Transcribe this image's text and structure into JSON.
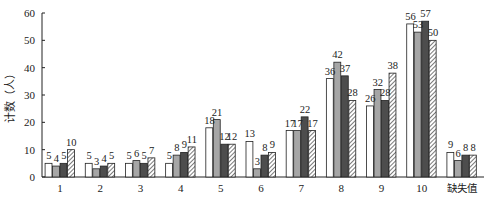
{
  "chart_data": {
    "type": "bar",
    "title": "",
    "xlabel": "",
    "ylabel": "计数（人）",
    "ylim": [
      0,
      60
    ],
    "yticks": [
      0,
      10,
      20,
      30,
      40,
      50,
      60
    ],
    "grid": false,
    "legend": null,
    "categories": [
      "1",
      "2",
      "3",
      "4",
      "5",
      "6",
      "7",
      "8",
      "9",
      "10",
      "缺失值"
    ],
    "series": [
      {
        "name": "series-1",
        "style": "white",
        "color": "#ffffff",
        "values": [
          5,
          5,
          5,
          5,
          18,
          13,
          17,
          36,
          26,
          56,
          9
        ]
      },
      {
        "name": "series-2",
        "style": "light-gray",
        "color": "#a6a6a6",
        "values": [
          4,
          3,
          6,
          8,
          21,
          3,
          17,
          42,
          32,
          53,
          6
        ]
      },
      {
        "name": "series-3",
        "style": "dark-gray",
        "color": "#4d4d4d",
        "values": [
          5,
          4,
          5,
          9,
          12,
          8,
          22,
          37,
          28,
          57,
          8
        ]
      },
      {
        "name": "series-4",
        "style": "hatched",
        "color": "#ffffff",
        "values": [
          10,
          5,
          7,
          11,
          12,
          9,
          17,
          28,
          38,
          50,
          8
        ]
      }
    ]
  }
}
